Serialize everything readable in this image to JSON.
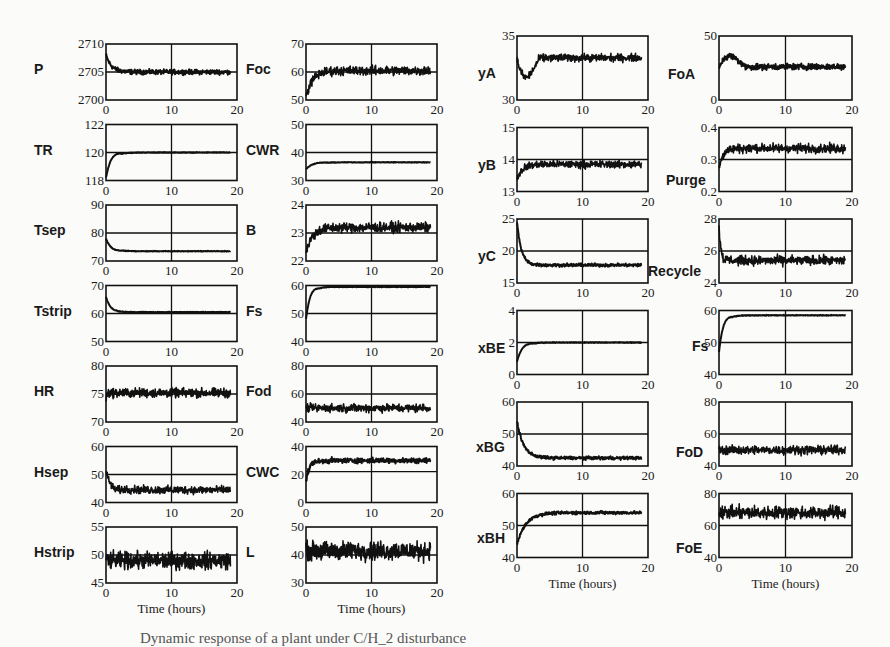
{
  "figure": {
    "caption_partial": "Dynamic response of a plant under C/H_2 disturbance",
    "x_axis_label": "Time (hours)",
    "x_ticks": [
      0,
      10,
      20
    ]
  },
  "chart_data": [
    {
      "type": "line",
      "id": "P",
      "title": "P",
      "col": 0,
      "row": 0,
      "xlabel": "",
      "ylim": [
        2700,
        2710
      ],
      "yticks": [
        "2700",
        "2705",
        "2710"
      ],
      "gridY": 2705,
      "x": [
        0,
        20
      ],
      "start": 2708,
      "settle": 2705,
      "settle_time": 2.5,
      "noise": 0.35,
      "overshoot": 0,
      "end": 19
    },
    {
      "type": "line",
      "id": "TR",
      "title": "TR",
      "col": 0,
      "row": 1,
      "xlabel": "",
      "ylim": [
        118,
        122
      ],
      "yticks": [
        "118",
        "120",
        "122"
      ],
      "gridY": 120,
      "start": 118.2,
      "settle": 120,
      "settle_time": 2.5,
      "noise": 0.02,
      "overshoot": 0.25,
      "end": 19
    },
    {
      "type": "line",
      "id": "Tsep",
      "title": "Tsep",
      "col": 0,
      "row": 2,
      "xlabel": "",
      "ylim": [
        70,
        90
      ],
      "yticks": [
        "70",
        "80",
        "90"
      ],
      "gridY": 80,
      "start": 78,
      "settle": 73.5,
      "settle_time": 2.5,
      "noise": 0.1,
      "overshoot": -0.5,
      "end": 19
    },
    {
      "type": "line",
      "id": "Tstrip",
      "title": "Tstrip",
      "col": 0,
      "row": 3,
      "xlabel": "",
      "ylim": [
        50,
        70
      ],
      "yticks": [
        "50",
        "60",
        "70"
      ],
      "gridY": 60,
      "start": 66,
      "settle": 60.5,
      "settle_time": 2,
      "noise": 0.1,
      "overshoot": 0,
      "end": 19
    },
    {
      "type": "line",
      "id": "HR",
      "title": "HR",
      "col": 0,
      "row": 4,
      "xlabel": "",
      "ylim": [
        70,
        80
      ],
      "yticks": [
        "70",
        "75",
        "80"
      ],
      "gridY": 75,
      "start": 74,
      "settle": 75.2,
      "settle_time": 0.3,
      "noise": 0.7,
      "overshoot": 0,
      "end": 19
    },
    {
      "type": "line",
      "id": "Hsep",
      "title": "Hsep",
      "col": 0,
      "row": 5,
      "xlabel": "",
      "ylim": [
        40,
        60
      ],
      "yticks": [
        "40",
        "50",
        "60"
      ],
      "gridY": 50,
      "start": 51,
      "settle": 44.5,
      "settle_time": 3,
      "noise": 1.2,
      "overshoot": -2,
      "end": 19
    },
    {
      "type": "line",
      "id": "Hstrip",
      "title": "Hstrip",
      "col": 0,
      "row": 6,
      "xlabel": "Time (hours)",
      "ylim": [
        45,
        55
      ],
      "yticks": [
        "45",
        "50",
        "55"
      ],
      "gridY": 50,
      "start": 49,
      "settle": 49,
      "settle_time": 0,
      "noise": 1.3,
      "overshoot": 0,
      "end": 19
    },
    {
      "type": "line",
      "id": "Foc",
      "title": "Foc",
      "col": 1,
      "row": 0,
      "xlabel": "",
      "ylim": [
        50,
        70
      ],
      "yticks": [
        "50",
        "60",
        "70"
      ],
      "gridY": 60,
      "start": 51,
      "settle": 60.5,
      "settle_time": 3,
      "noise": 1.4,
      "overshoot": 0,
      "end": 19
    },
    {
      "type": "line",
      "id": "CWR",
      "title": "CWR",
      "col": 1,
      "row": 1,
      "xlabel": "",
      "ylim": [
        30,
        50
      ],
      "yticks": [
        "30",
        "40",
        "50"
      ],
      "gridY": 40,
      "start": 34,
      "settle": 36.5,
      "settle_time": 3.5,
      "noise": 0.1,
      "overshoot": 0.5,
      "end": 19
    },
    {
      "type": "line",
      "id": "B",
      "title": "B",
      "col": 1,
      "row": 2,
      "xlabel": "",
      "ylim": [
        22,
        24
      ],
      "yticks": [
        "22",
        "23",
        "24"
      ],
      "gridY": 23,
      "start": 22.3,
      "settle": 23.2,
      "settle_time": 3,
      "noise": 0.15,
      "overshoot": 0,
      "end": 19
    },
    {
      "type": "line",
      "id": "Fs_left",
      "title": "Fs",
      "col": 1,
      "row": 3,
      "xlabel": "",
      "ylim": [
        40,
        60
      ],
      "yticks": [
        "40",
        "50",
        "60"
      ],
      "gridY": 50,
      "start": 48,
      "settle": 59.5,
      "settle_time": 2,
      "noise": 0.1,
      "overshoot": 1,
      "end": 19
    },
    {
      "type": "line",
      "id": "Fod",
      "title": "Fod",
      "col": 1,
      "row": 4,
      "xlabel": "",
      "ylim": [
        40,
        80
      ],
      "yticks": [
        "40",
        "60",
        "80"
      ],
      "gridY": 60,
      "start": 50,
      "settle": 50,
      "settle_time": 0,
      "noise": 2.5,
      "overshoot": 0,
      "end": 19
    },
    {
      "type": "line",
      "id": "CWC",
      "title": "CWC",
      "col": 1,
      "row": 5,
      "xlabel": "",
      "ylim": [
        0,
        40
      ],
      "yticks": [
        "0",
        "20",
        "40"
      ],
      "gridY": 22,
      "start": 15,
      "settle": 30,
      "settle_time": 2,
      "noise": 1.5,
      "overshoot": 2,
      "end": 19
    },
    {
      "type": "line",
      "id": "L",
      "title": "L",
      "col": 1,
      "row": 6,
      "xlabel": "Time (hours)",
      "ylim": [
        30,
        50
      ],
      "yticks": [
        "30",
        "40",
        "50"
      ],
      "gridY": 40,
      "start": 41,
      "settle": 41.5,
      "settle_time": 0,
      "noise": 2.8,
      "overshoot": 0,
      "end": 19
    },
    {
      "type": "line",
      "id": "yA",
      "title": "yA",
      "col": 2,
      "row": 0,
      "xlabel": "",
      "ylim": [
        30,
        35
      ],
      "yticks": [
        "30",
        "35"
      ],
      "gridY": null,
      "start": 33.2,
      "settle": 33.3,
      "settle_time": 3.5,
      "noise": 0.25,
      "overshoot": -2.4,
      "end": 19
    },
    {
      "type": "line",
      "id": "yB",
      "title": "yB",
      "col": 2,
      "row": 1,
      "xlabel": "",
      "ylim": [
        13,
        15
      ],
      "yticks": [
        "13",
        "14",
        "15"
      ],
      "gridY": 14,
      "start": 13.4,
      "settle": 13.85,
      "settle_time": 2.5,
      "noise": 0.1,
      "overshoot": 0,
      "end": 19
    },
    {
      "type": "line",
      "id": "yC",
      "title": "yC",
      "col": 2,
      "row": 2,
      "xlabel": "",
      "ylim": [
        15,
        25
      ],
      "yticks": [
        "15",
        "20",
        "25"
      ],
      "gridY": 20,
      "start": 24.5,
      "settle": 17.8,
      "settle_time": 2,
      "noise": 0.2,
      "overshoot": 0,
      "end": 19
    },
    {
      "type": "line",
      "id": "xBE",
      "title": "xBE",
      "col": 2,
      "row": 3,
      "xlabel": "",
      "ylim": [
        0,
        4
      ],
      "yticks": [
        "0",
        "2",
        "4"
      ],
      "gridY": 2,
      "start": 0.8,
      "settle": 2,
      "settle_time": 2.5,
      "noise": 0.02,
      "overshoot": 0.1,
      "end": 19
    },
    {
      "type": "line",
      "id": "xBG",
      "title": "xBG",
      "col": 2,
      "row": 4,
      "xlabel": "",
      "ylim": [
        40,
        60
      ],
      "yticks": [
        "40",
        "50",
        "60"
      ],
      "gridY": 50,
      "start": 54,
      "settle": 42.5,
      "settle_time": 3,
      "noise": 0.4,
      "overshoot": 0,
      "end": 19
    },
    {
      "type": "line",
      "id": "xBH",
      "title": "xBH",
      "col": 2,
      "row": 5,
      "xlabel": "Time (hours)",
      "ylim": [
        40,
        60
      ],
      "yticks": [
        "40",
        "50",
        "60"
      ],
      "gridY": 50,
      "start": 44,
      "settle": 54,
      "settle_time": 4,
      "noise": 0.4,
      "overshoot": 0,
      "end": 19
    },
    {
      "type": "line",
      "id": "FoA",
      "title": "FoA",
      "col": 3,
      "row": 0,
      "xlabel": "",
      "ylim": [
        0,
        50
      ],
      "yticks": [
        "0",
        "50"
      ],
      "gridY": null,
      "start": 25,
      "settle": 26,
      "settle_time": 4,
      "noise": 2,
      "overshoot": 15,
      "end": 19
    },
    {
      "type": "line",
      "id": "Purge",
      "title": "Purge",
      "col": 3,
      "row": 1,
      "xlabel": "",
      "ylim": [
        0.2,
        0.4
      ],
      "yticks": [
        "0.2",
        "0.3",
        "0.4"
      ],
      "gridY": 0.3,
      "start": 0.28,
      "settle": 0.335,
      "settle_time": 2,
      "noise": 0.012,
      "overshoot": 0,
      "end": 19
    },
    {
      "type": "line",
      "id": "Recycle",
      "title": "Recycle",
      "col": 3,
      "row": 2,
      "xlabel": "",
      "ylim": [
        24,
        28
      ],
      "yticks": [
        "24",
        "26",
        "28"
      ],
      "gridY": 26,
      "start": 27.5,
      "settle": 25.4,
      "settle_time": 1.2,
      "noise": 0.25,
      "overshoot": -0.3,
      "end": 19
    },
    {
      "type": "line",
      "id": "Fs_right",
      "title": "Fs",
      "col": 3,
      "row": 3,
      "xlabel": "",
      "ylim": [
        40,
        60
      ],
      "yticks": [
        "40",
        "50",
        "60"
      ],
      "gridY": 50,
      "start": 47,
      "settle": 58.5,
      "settle_time": 2,
      "noise": 0.1,
      "overshoot": 1,
      "end": 19
    },
    {
      "type": "line",
      "id": "FoD",
      "title": "FoD",
      "col": 3,
      "row": 4,
      "xlabel": "",
      "ylim": [
        40,
        80
      ],
      "yticks": [
        "40",
        "60",
        "80"
      ],
      "gridY": 60,
      "start": 50,
      "settle": 50,
      "settle_time": 0,
      "noise": 2.3,
      "overshoot": 0,
      "end": 19
    },
    {
      "type": "line",
      "id": "FoE",
      "title": "FoE",
      "col": 3,
      "row": 5,
      "xlabel": "Time (hours)",
      "ylim": [
        40,
        80
      ],
      "yticks": [
        "40",
        "60",
        "80"
      ],
      "gridY": 60,
      "start": 68,
      "settle": 68,
      "settle_time": 0,
      "noise": 3.5,
      "overshoot": 0,
      "end": 19
    }
  ]
}
